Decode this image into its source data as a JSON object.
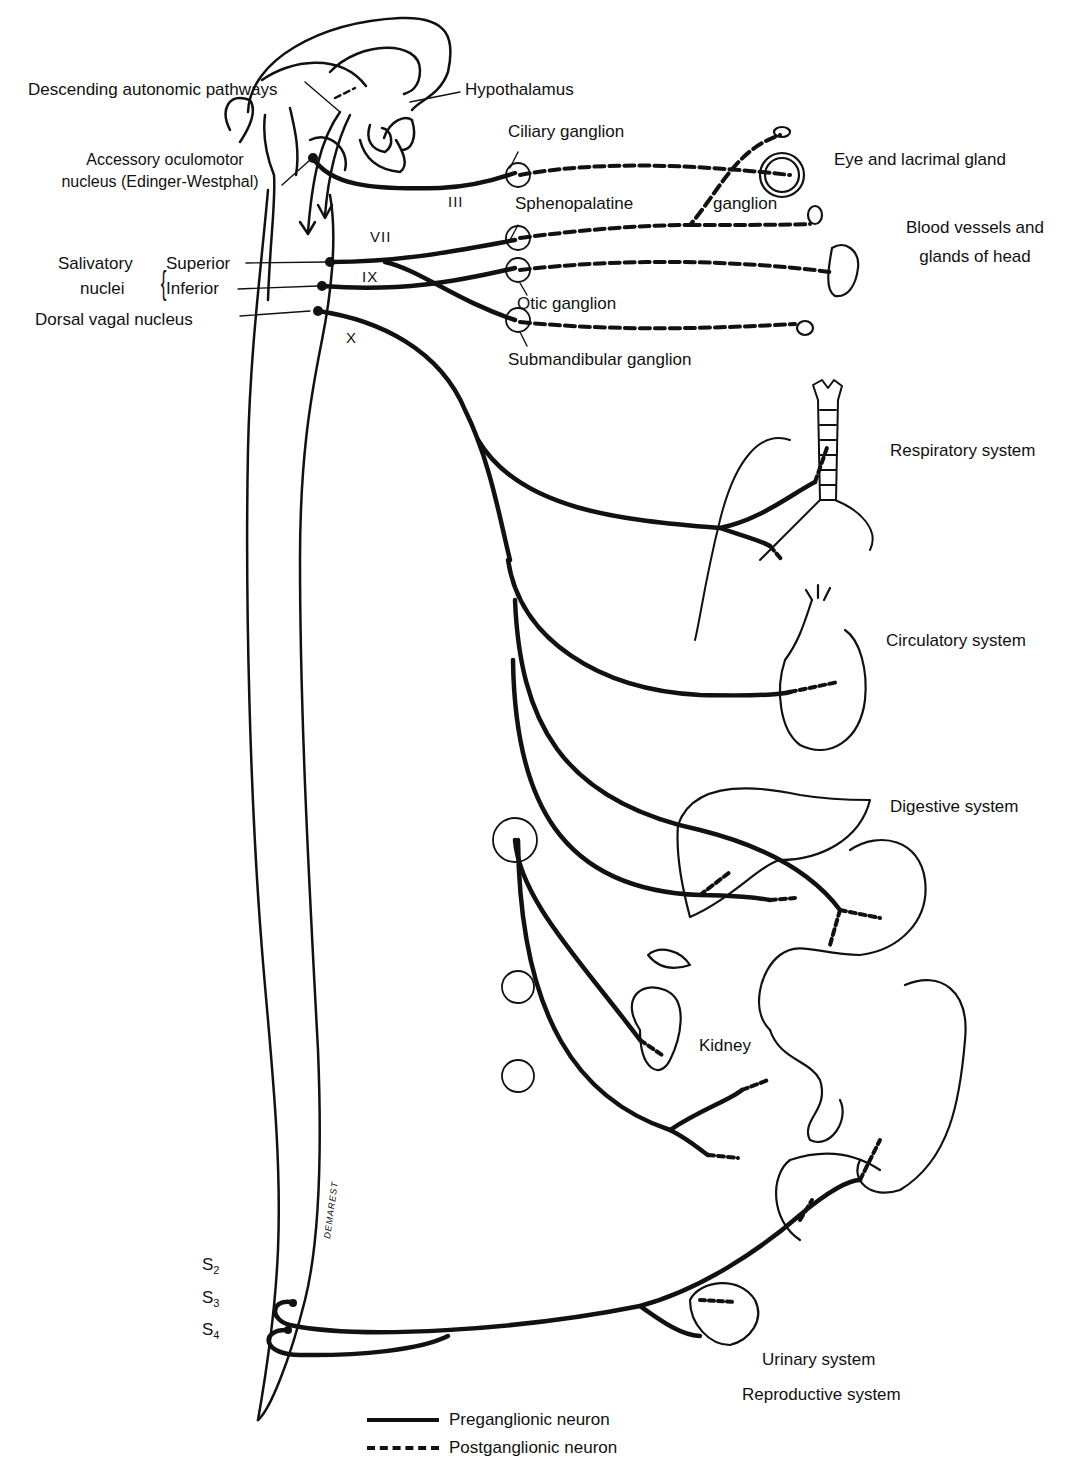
{
  "figure": {
    "signature": "DEMAREST"
  },
  "labels": {
    "descending_pathways": "Descending autonomic pathways",
    "hypothalamus": "Hypothalamus",
    "accessory_oculomotor_line1": "Accessory oculomotor",
    "accessory_oculomotor_line2": "nucleus (Edinger-Westphal)",
    "salivatory_line1": "Salivatory",
    "salivatory_line2": "nuclei",
    "superior": "Superior",
    "inferior": "Inferior",
    "dorsal_vagal": "Dorsal vagal nucleus"
  },
  "cranial_nerves": {
    "III": "III",
    "VII": "VII",
    "IX": "IX",
    "X": "X"
  },
  "ganglia": {
    "ciliary": "Ciliary ganglion",
    "sphenopalatine_a": "Sphenopalatine",
    "sphenopalatine_b": "ganglion",
    "otic": "Otic ganglion",
    "submandibular": "Submandibular ganglion"
  },
  "targets": {
    "eye": "Eye and lacrimal gland",
    "blood_vessels_line1": "Blood vessels and",
    "blood_vessels_line2": "glands of head",
    "respiratory": "Respiratory system",
    "circulatory": "Circulatory system",
    "digestive": "Digestive system",
    "kidney": "Kidney",
    "urinary": "Urinary system",
    "reproductive": "Reproductive system"
  },
  "sacral": {
    "s2": "S",
    "s2_sub": "2",
    "s3": "S",
    "s3_sub": "3",
    "s4": "S",
    "s4_sub": "4"
  },
  "legend": {
    "solid": "Preganglionic neuron",
    "dashed": "Postganglionic neuron"
  },
  "colors": {
    "ink": "#111111",
    "background": "#ffffff"
  }
}
